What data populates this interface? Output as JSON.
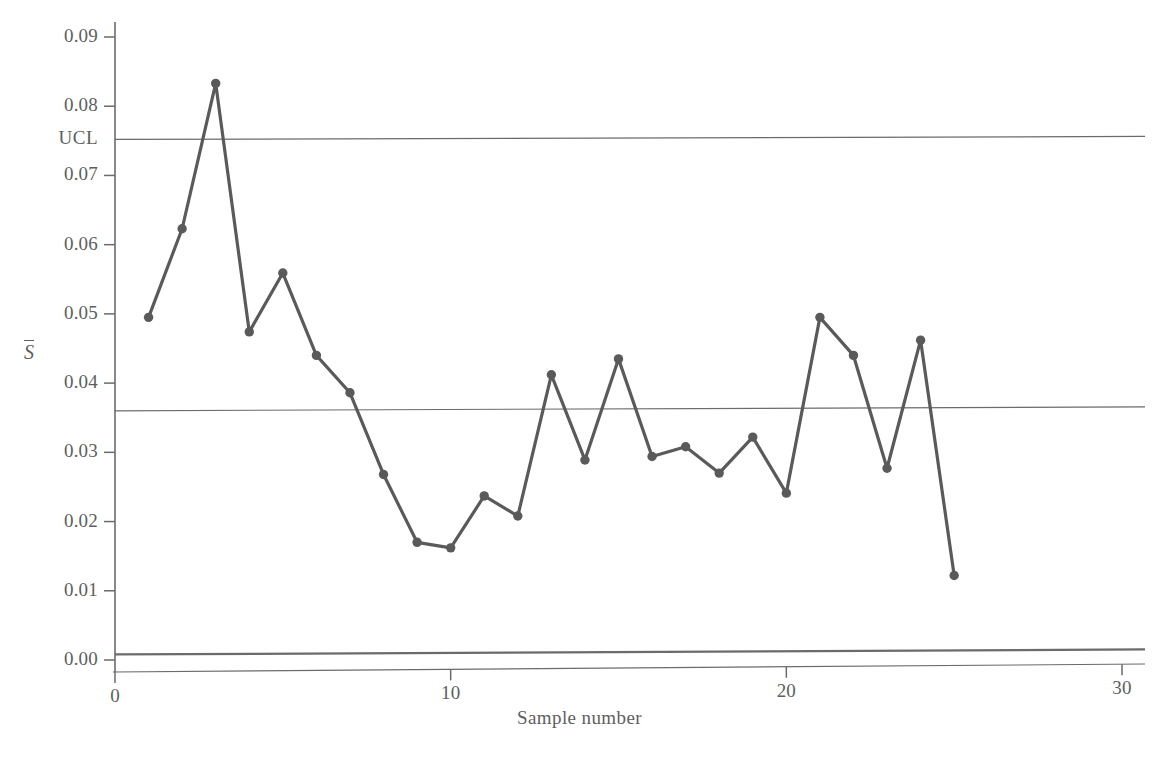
{
  "chart_data": {
    "type": "line",
    "title": "",
    "xlabel": "Sample number",
    "ylabel": "S̄",
    "ylabel_base": "S",
    "x": [
      1,
      2,
      3,
      4,
      5,
      6,
      7,
      8,
      9,
      10,
      11,
      12,
      13,
      14,
      15,
      16,
      17,
      18,
      19,
      20,
      21,
      22,
      23,
      24,
      25
    ],
    "values": [
      0.0495,
      0.0623,
      0.0833,
      0.0474,
      0.0559,
      0.044,
      0.0386,
      0.0268,
      0.017,
      0.0162,
      0.0237,
      0.0208,
      0.0412,
      0.0289,
      0.0435,
      0.0294,
      0.0308,
      0.027,
      0.0322,
      0.0241,
      0.0495,
      0.044,
      0.0277,
      0.0462,
      0.0122
    ],
    "xlim": [
      0,
      30
    ],
    "ylim": [
      0.0,
      0.09
    ],
    "xticks": [
      0,
      10,
      20,
      30
    ],
    "xtick_labels": [
      "0",
      "10",
      "20",
      "30"
    ],
    "yticks": [
      0.0,
      0.01,
      0.02,
      0.03,
      0.04,
      0.05,
      0.06,
      0.07,
      0.08,
      0.09
    ],
    "ytick_labels": [
      "0.00",
      "0.01",
      "0.02",
      "0.03",
      "0.04",
      "0.05",
      "0.06",
      "0.07",
      "0.08",
      "0.09"
    ],
    "grid": false,
    "legend": "none",
    "series_color": "#5a5a5a",
    "axis_color": "#6b6b6b",
    "control_limits": [
      {
        "name": "UCL",
        "label": "UCL",
        "value": 0.0752,
        "show_label": true
      },
      {
        "name": "center-line",
        "label": "",
        "value": 0.036,
        "show_label": false
      },
      {
        "name": "LCL",
        "label": "",
        "value": 0.0008,
        "show_label": false
      }
    ],
    "marker": "circle",
    "marker_size": 7
  }
}
